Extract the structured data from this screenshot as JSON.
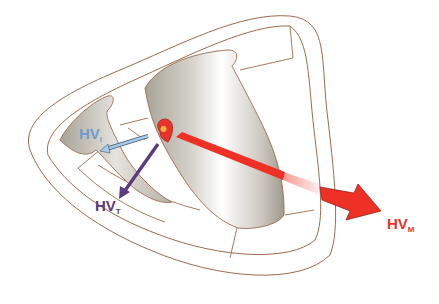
{
  "diagram": {
    "type": "heart vector diagram",
    "labels": [
      {
        "id": "hv_i",
        "main": "HV",
        "sub": "I",
        "color": "#6f9bd1"
      },
      {
        "id": "hv_t",
        "main": "HV",
        "sub": "T",
        "color": "#5c3a7e"
      },
      {
        "id": "hv_m",
        "main": "HV",
        "sub": "M",
        "color": "#e8332b"
      }
    ],
    "colors": {
      "outline": "#9c6b4e",
      "chamber_shadow": "#b9b4a8",
      "origin": "#e8332b",
      "origin_center": "#f5b33c",
      "arrow_i": "#8fb6d9",
      "arrow_t": "#5c3a7e",
      "arrow_m": "#ee3124"
    }
  }
}
